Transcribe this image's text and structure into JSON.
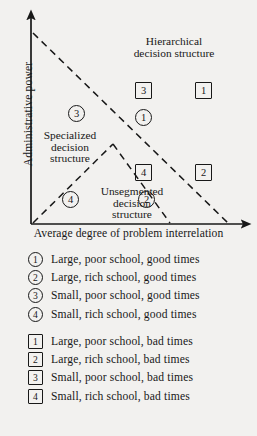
{
  "figure": {
    "axes": {
      "y_label": "Administrative power",
      "x_label": "Average degree of problem interrelation"
    },
    "zones": [
      {
        "id": "hierarchical",
        "line1": "Hierarchical",
        "line2": "decision  structure"
      },
      {
        "id": "specialized",
        "line1": "Specialized",
        "line2": "decision",
        "line3": "structure"
      },
      {
        "id": "unsegmented",
        "line1": "Unsegmented",
        "line2": "decision",
        "line3": "structure"
      }
    ],
    "plot_markers": [
      {
        "name": "square-3",
        "shape": "square",
        "label": "3",
        "x": 143,
        "y": 90
      },
      {
        "name": "square-1",
        "shape": "square",
        "label": "1",
        "x": 203,
        "y": 90
      },
      {
        "name": "circle-1",
        "shape": "circle",
        "label": "1",
        "x": 143,
        "y": 117
      },
      {
        "name": "circle-3",
        "shape": "circle",
        "label": "3",
        "x": 76,
        "y": 113
      },
      {
        "name": "square-4",
        "shape": "square",
        "label": "4",
        "x": 143,
        "y": 172
      },
      {
        "name": "square-2",
        "shape": "square",
        "label": "2",
        "x": 203,
        "y": 172
      },
      {
        "name": "circle-4",
        "shape": "circle",
        "label": "4",
        "x": 70,
        "y": 199
      },
      {
        "name": "circle-2",
        "shape": "circle",
        "label": "2",
        "x": 146,
        "y": 199
      }
    ],
    "legend_good": [
      {
        "shape": "circle",
        "label": "1",
        "text": "Large, poor school, good times"
      },
      {
        "shape": "circle",
        "label": "2",
        "text": "Large, rich school, good times"
      },
      {
        "shape": "circle",
        "label": "3",
        "text": "Small, poor school, good times"
      },
      {
        "shape": "circle",
        "label": "4",
        "text": "Small, rich school, good times"
      }
    ],
    "legend_bad": [
      {
        "shape": "square",
        "label": "1",
        "text": "Large, poor school, bad times"
      },
      {
        "shape": "square",
        "label": "2",
        "text": "Large, rich school, bad times"
      },
      {
        "shape": "square",
        "label": "3",
        "text": "Small, poor school, bad times"
      },
      {
        "shape": "square",
        "label": "4",
        "text": "Small, rich school, bad times"
      }
    ]
  },
  "chart_data": {
    "type": "scatter",
    "title": "",
    "xlabel": "Average degree of problem interrelation",
    "ylabel": "Administrative power",
    "grid": false,
    "legend_position": "below-plot",
    "xlim": [
      0,
      1
    ],
    "ylim": [
      0,
      1
    ],
    "axis_ticks": [],
    "regions": [
      {
        "name": "Hierarchical decision structure",
        "boundary": "above main descending diagonal"
      },
      {
        "name": "Specialized decision structure",
        "boundary": "left wedge below main diagonal"
      },
      {
        "name": "Unsegmented decision structure",
        "boundary": "bottom wedge below diagonals"
      }
    ],
    "boundary_lines": [
      {
        "name": "main-diagonal",
        "style": "dashed",
        "from": [
          0.0,
          0.9
        ],
        "to": [
          0.89,
          0.0
        ]
      },
      {
        "name": "lower-left-diagonal",
        "style": "dashed",
        "from": [
          0.0,
          0.0
        ],
        "to": [
          0.37,
          0.37
        ]
      },
      {
        "name": "lower-right-diagonal",
        "style": "dashed",
        "from": [
          0.37,
          0.37
        ],
        "to": [
          0.63,
          0.0
        ]
      }
    ],
    "series": [
      {
        "name": "good times (circles)",
        "marker": "circle",
        "points": [
          {
            "label": "1",
            "x": 0.51,
            "y": 0.5,
            "desc": "Large, poor school, good times"
          },
          {
            "label": "2",
            "x": 0.53,
            "y": 0.11,
            "desc": "Large, rich school, good times"
          },
          {
            "label": "3",
            "x": 0.21,
            "y": 0.52,
            "desc": "Small, poor school, good times"
          },
          {
            "label": "4",
            "x": 0.18,
            "y": 0.11,
            "desc": "Small, rich school, good times"
          }
        ]
      },
      {
        "name": "bad times (squares)",
        "marker": "square",
        "points": [
          {
            "label": "1",
            "x": 0.79,
            "y": 0.63,
            "desc": "Large, poor school, bad times"
          },
          {
            "label": "2",
            "x": 0.79,
            "y": 0.24,
            "desc": "Large, rich school, bad times"
          },
          {
            "label": "3",
            "x": 0.52,
            "y": 0.63,
            "desc": "Small, poor school, bad times"
          },
          {
            "label": "4",
            "x": 0.52,
            "y": 0.24,
            "desc": "Small, rich school, bad times"
          }
        ]
      }
    ]
  }
}
